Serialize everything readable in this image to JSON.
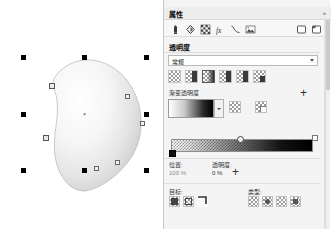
{
  "app": {
    "name": "CorelDRAW Properties Docker",
    "canvas_background": "#ffffff"
  },
  "docker": {
    "title": "属性",
    "collapse_glyph": "»",
    "toolbar": {
      "items": [
        {
          "name": "outline-pen-icon",
          "label": "轮廓"
        },
        {
          "name": "fill-icon",
          "label": "填充"
        },
        {
          "name": "transparency-icon",
          "label": "透明度"
        },
        {
          "name": "effects-fx-icon",
          "label": "效果"
        },
        {
          "name": "curve-icon",
          "label": "曲线"
        },
        {
          "name": "bitmap-icon",
          "label": "位图"
        }
      ],
      "right_items": [
        {
          "name": "page-icon",
          "label": "页面"
        },
        {
          "name": "page-layout-icon",
          "label": "布局"
        }
      ]
    },
    "transparency": {
      "section_label": "透明度",
      "merge_mode": {
        "value": "常规",
        "placeholder": "常规"
      },
      "type_buttons": [
        {
          "name": "no-transparency-button",
          "label": "无透明度",
          "selected": false
        },
        {
          "name": "uniform-transparency-button",
          "label": "均匀透明度",
          "selected": false
        },
        {
          "name": "fountain-transparency-button",
          "label": "渐变透明度",
          "selected": true
        },
        {
          "name": "vector-pattern-transparency-button",
          "label": "向量图样透明度",
          "selected": false
        },
        {
          "name": "bitmap-pattern-transparency-button",
          "label": "位图图样透明度",
          "selected": false
        },
        {
          "name": "texture-transparency-button",
          "label": "底纹透明度",
          "selected": false
        }
      ],
      "gradient": {
        "label": "渐变透明度",
        "add_label": "+",
        "preview_colors": [
          "#ffffff",
          "#000000"
        ],
        "swatch_buttons": [
          {
            "name": "edit-transparency-button",
            "label": "编辑透明度"
          },
          {
            "name": "copy-transparency-button",
            "label": "复制透明度"
          }
        ]
      },
      "ramp": {
        "name": "gradient-ramp",
        "start_stop": {
          "position": "0 %",
          "transparency": "0 %"
        },
        "mid_node_position": "50 %",
        "end_stop": {
          "position": "100 %",
          "transparency": "100 %"
        }
      },
      "fields": {
        "position_label": "位置:",
        "position_value": "100 %",
        "transparency_label": "透明度:",
        "transparency_value": "0 %",
        "add_node_label": "+"
      },
      "target": {
        "label": "目标:",
        "buttons": [
          {
            "name": "target-fill-button",
            "label": "填充"
          },
          {
            "name": "target-outline-button",
            "label": "轮廓"
          },
          {
            "name": "target-all-button",
            "label": "全部"
          }
        ]
      },
      "type": {
        "label": "类型:",
        "buttons": [
          {
            "name": "type-linear-button",
            "label": "线性"
          },
          {
            "name": "type-elliptical-button",
            "label": "椭圆形"
          },
          {
            "name": "type-conical-button",
            "label": "圆锥形"
          },
          {
            "name": "type-rectangular-button",
            "label": "矩形"
          }
        ]
      }
    }
  },
  "canvas": {
    "selection": {
      "name": "selected-shape",
      "handles_count": 8,
      "center_marker": "×",
      "shape_fill": "gradient-white-to-gray",
      "shape_outline": "#b4b4b4"
    }
  }
}
